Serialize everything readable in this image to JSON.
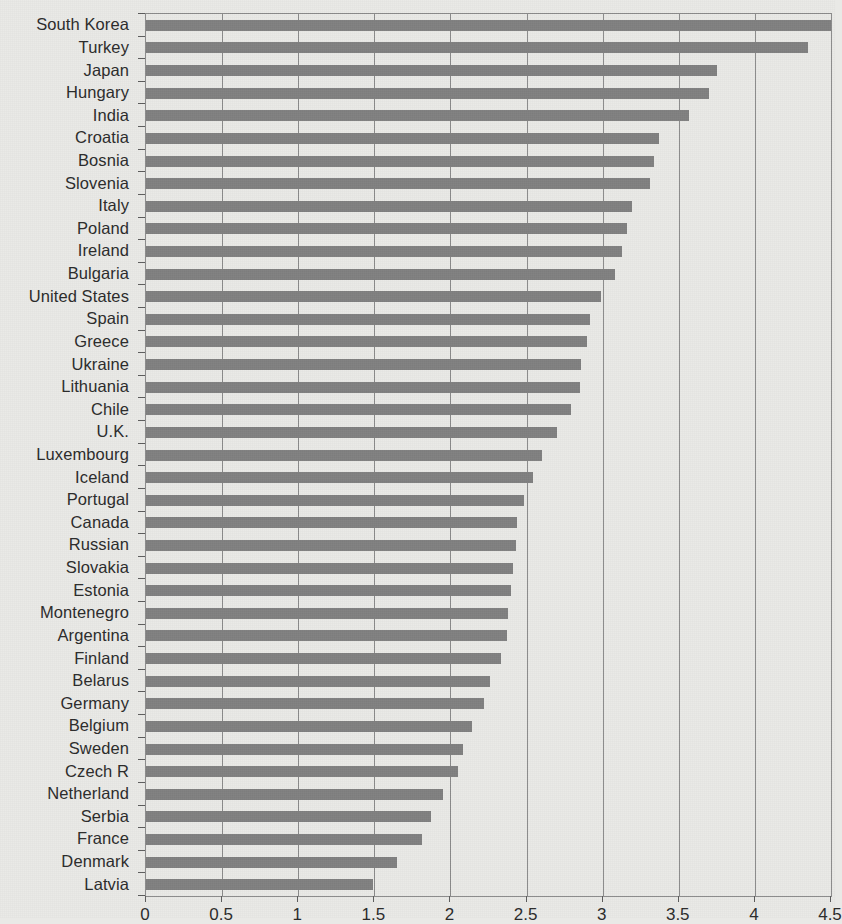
{
  "chart_data": {
    "type": "bar",
    "orientation": "horizontal",
    "title": "",
    "subtitle": "",
    "xlabel": "",
    "ylabel": "",
    "xlim": [
      0,
      4.5
    ],
    "grid": true,
    "grid_axis": "x",
    "legend": null,
    "bar_color": "#808080",
    "background_color": "#e9e9e6",
    "axis_color": "#8b8b8b",
    "xticks": [
      "0",
      "0.5",
      "1",
      "1.5",
      "2",
      "2.5",
      "3",
      "3.5",
      "4",
      "4.5"
    ],
    "xtick_values": [
      0,
      0.5,
      1,
      1.5,
      2,
      2.5,
      3,
      3.5,
      4,
      4.5
    ],
    "categories": [
      "South Korea",
      "Turkey",
      "Japan",
      "Hungary",
      "India",
      "Croatia",
      "Bosnia",
      "Slovenia",
      "Italy",
      "Poland",
      "Ireland",
      "Bulgaria",
      "United States",
      "Spain",
      "Greece",
      "Ukraine",
      "Lithuania",
      "Chile",
      "U.K.",
      "Luxembourg",
      "Iceland",
      "Portugal",
      "Canada",
      "Russian",
      "Slovakia",
      "Estonia",
      "Montenegro",
      "Argentina",
      "Finland",
      "Belarus",
      "Germany",
      "Belgium",
      "Sweden",
      "Czech R",
      "Netherland",
      "Serbia",
      "France",
      "Denmark",
      "Latvia"
    ],
    "values": [
      4.5,
      4.35,
      3.75,
      3.7,
      3.57,
      3.37,
      3.34,
      3.31,
      3.19,
      3.16,
      3.13,
      3.08,
      2.99,
      2.92,
      2.9,
      2.86,
      2.85,
      2.79,
      2.7,
      2.6,
      2.54,
      2.48,
      2.44,
      2.43,
      2.41,
      2.4,
      2.38,
      2.37,
      2.33,
      2.26,
      2.22,
      2.14,
      2.08,
      2.05,
      1.95,
      1.87,
      1.81,
      1.65,
      1.49
    ]
  }
}
